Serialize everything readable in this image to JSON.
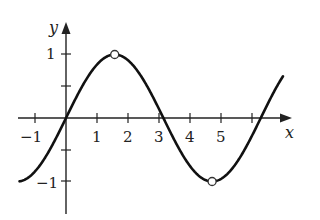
{
  "chart_data": {
    "type": "line",
    "title": "",
    "function": "y = sin(x)",
    "xlabel": "x",
    "ylabel": "y",
    "xlim": [
      -1.5,
      7.2
    ],
    "ylim": [
      -1.4,
      1.5
    ],
    "grid": false,
    "legend": null,
    "x_ticks": [
      -1,
      1,
      2,
      3,
      4,
      5,
      6
    ],
    "x_tick_labels": [
      "−1",
      "1",
      "2",
      "3",
      "4",
      "5",
      ""
    ],
    "y_ticks": [
      1,
      0.5,
      -0.5,
      -1
    ],
    "y_tick_labels": [
      "1",
      "",
      "",
      "−1"
    ],
    "series": [
      {
        "name": "sin(x)",
        "x": [
          -1.5,
          -1,
          -0.5,
          0,
          0.5,
          1,
          1.5708,
          2,
          2.5,
          3,
          3.1416,
          3.5,
          4,
          4.5,
          4.7124,
          5,
          5.5,
          6,
          6.2832,
          6.7
        ],
        "y": [
          -0.997,
          -0.841,
          -0.479,
          0,
          0.479,
          0.841,
          1,
          0.909,
          0.598,
          0.141,
          0,
          -0.351,
          -0.757,
          -0.978,
          -1,
          -0.959,
          -0.706,
          -0.279,
          0,
          0.405
        ]
      }
    ],
    "annotations": [
      {
        "type": "open-circle",
        "x": 1.5708,
        "y": 1,
        "label": "maximum (π/2, 1)"
      },
      {
        "type": "open-circle",
        "x": 4.7124,
        "y": -1,
        "label": "minimum (3π/2, −1)"
      }
    ]
  },
  "axes": {
    "x_label": "x",
    "y_label": "y"
  },
  "ticks": {
    "xm1": "−1",
    "x1": "1",
    "x2": "2",
    "x3": "3",
    "x4": "4",
    "x5": "5",
    "y1": "1",
    "ym1": "−1"
  }
}
